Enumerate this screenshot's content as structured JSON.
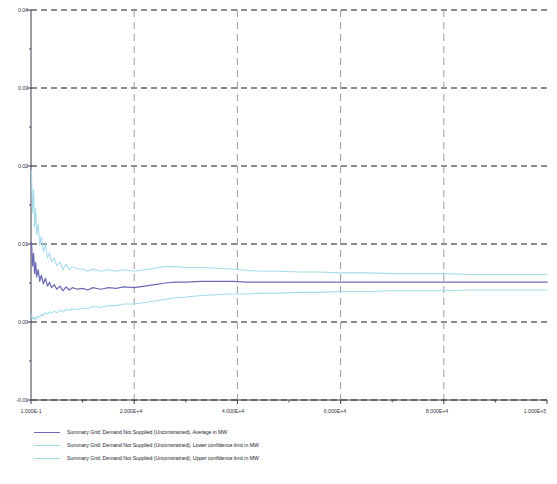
{
  "chart_data": {
    "type": "line",
    "title": "",
    "xlabel": "",
    "ylabel": "",
    "xscale": "linear",
    "grid": true,
    "legend_position": "below-plot",
    "xlim": [
      0,
      100000
    ],
    "ylim": [
      -0.01,
      0.04
    ],
    "y_ticks": [
      "0.04",
      "0.03",
      "0.02",
      "0.01",
      "0.00",
      "-0.01"
    ],
    "y_tick_values": [
      0.04,
      0.03,
      0.02,
      0.01,
      0.0,
      -0.01
    ],
    "y_minor_tick_values": [
      0.035,
      0.025,
      0.015,
      0.005,
      -0.005
    ],
    "x_ticks": [
      "1.000E-1",
      "2.000E+4",
      "4.000E+4",
      "6.000E+4",
      "8.000E+4",
      "1.000E+5"
    ],
    "x_tick_values": [
      0.1,
      20000,
      40000,
      60000,
      80000,
      100000
    ],
    "x_minor_tick_values": [
      10000,
      30000,
      50000,
      70000,
      90000
    ],
    "x_vertical_gridlines": [
      20000,
      40000,
      60000,
      80000
    ],
    "series": [
      {
        "name": "Summary Grid: Demand Not Supplied (Unconstrained), Average in MW",
        "color": "#6b6bb5",
        "short": "average",
        "x": [
          100,
          300,
          500,
          700,
          900,
          1100,
          1400,
          1700,
          2000,
          2400,
          2800,
          3200,
          3600,
          4000,
          4500,
          5000,
          5600,
          6200,
          6800,
          7400,
          8000,
          9000,
          10000,
          11000,
          12000,
          13500,
          15000,
          16500,
          18000,
          20000,
          22000,
          24000,
          26000,
          28000,
          30000,
          33000,
          36000,
          39000,
          42000,
          45000,
          48000,
          52000,
          56000,
          60000,
          65000,
          70000,
          75000,
          80000,
          85000,
          90000,
          95000,
          100000
        ],
        "values": [
          0.0102,
          0.0072,
          0.0088,
          0.0062,
          0.0076,
          0.0058,
          0.0067,
          0.0052,
          0.006,
          0.0049,
          0.0056,
          0.0046,
          0.0051,
          0.0044,
          0.0048,
          0.0042,
          0.0046,
          0.004,
          0.0045,
          0.0041,
          0.0044,
          0.0042,
          0.0043,
          0.0041,
          0.0044,
          0.0042,
          0.0044,
          0.0043,
          0.0045,
          0.0044,
          0.0046,
          0.0048,
          0.005,
          0.0051,
          0.0051,
          0.0052,
          0.0052,
          0.0052,
          0.0051,
          0.0051,
          0.0051,
          0.0051,
          0.0051,
          0.0051,
          0.0051,
          0.0051,
          0.0051,
          0.0051,
          0.0051,
          0.0051,
          0.0051,
          0.0051
        ]
      },
      {
        "name": "Summary Grid: Demand Not Supplied (Unconstrained), Lower confidence limit in MW",
        "color": "#a6dcea",
        "short": "lower",
        "x": [
          100,
          300,
          500,
          700,
          900,
          1100,
          1400,
          1700,
          2000,
          2400,
          2800,
          3200,
          3600,
          4000,
          4500,
          5000,
          5600,
          6200,
          6800,
          7400,
          8000,
          9000,
          10000,
          11000,
          12000,
          13500,
          15000,
          16500,
          18000,
          20000,
          22000,
          24000,
          26000,
          28000,
          30000,
          33000,
          36000,
          39000,
          42000,
          45000,
          48000,
          52000,
          56000,
          60000,
          65000,
          70000,
          75000,
          80000,
          85000,
          90000,
          95000,
          100000
        ],
        "values": [
          0.001,
          0.0004,
          0.0006,
          0.0003,
          0.0006,
          0.0004,
          0.0008,
          0.0006,
          0.001,
          0.0008,
          0.0012,
          0.001,
          0.0013,
          0.0011,
          0.0014,
          0.0012,
          0.0015,
          0.0013,
          0.0016,
          0.0015,
          0.0017,
          0.0016,
          0.0018,
          0.0017,
          0.002,
          0.0019,
          0.0021,
          0.0021,
          0.0023,
          0.0023,
          0.0025,
          0.0027,
          0.0029,
          0.0031,
          0.0032,
          0.0034,
          0.0035,
          0.0036,
          0.0036,
          0.0037,
          0.0037,
          0.0038,
          0.0038,
          0.0039,
          0.0039,
          0.004,
          0.004,
          0.004,
          0.0041,
          0.0041,
          0.0041,
          0.0041
        ]
      },
      {
        "name": "Summary Grid: Demand Not Supplied (Unconstrained), Upper confidence limit in MW",
        "color": "#a6dcea",
        "short": "upper",
        "x": [
          100,
          300,
          500,
          700,
          900,
          1100,
          1400,
          1700,
          2000,
          2400,
          2800,
          3200,
          3600,
          4000,
          4500,
          5000,
          5600,
          6200,
          6800,
          7400,
          8000,
          9000,
          10000,
          11000,
          12000,
          13500,
          15000,
          16500,
          18000,
          20000,
          22000,
          24000,
          26000,
          28000,
          30000,
          33000,
          36000,
          39000,
          42000,
          45000,
          48000,
          52000,
          56000,
          60000,
          65000,
          70000,
          75000,
          80000,
          85000,
          90000,
          95000,
          100000
        ],
        "values": [
          0.0194,
          0.014,
          0.017,
          0.0121,
          0.0146,
          0.0112,
          0.0126,
          0.0098,
          0.011,
          0.009,
          0.01,
          0.0082,
          0.0089,
          0.0077,
          0.0082,
          0.0072,
          0.0077,
          0.0067,
          0.0074,
          0.0067,
          0.0071,
          0.0068,
          0.0068,
          0.0065,
          0.0068,
          0.0065,
          0.0067,
          0.0065,
          0.0067,
          0.0065,
          0.0067,
          0.0069,
          0.0071,
          0.0071,
          0.007,
          0.007,
          0.0069,
          0.0068,
          0.0066,
          0.0065,
          0.0065,
          0.0064,
          0.0064,
          0.0063,
          0.0063,
          0.0062,
          0.0062,
          0.0062,
          0.0061,
          0.0061,
          0.0061,
          0.0061
        ]
      }
    ]
  },
  "axes": {
    "y_tick_labels": [
      "0.04",
      "0.03",
      "0.02",
      "0.01",
      "0.00",
      "-0.01"
    ],
    "x_tick_labels": [
      "1.000E-1",
      "2.000E+4",
      "4.000E+4",
      "6.000E+4",
      "8.000E+4",
      "1.000E+5"
    ]
  },
  "legend": {
    "entries": [
      {
        "label": "Summary Grid: Demand Not Supplied (Unconstrained), Average in MW",
        "color": "#6b6bb5"
      },
      {
        "label": "Summary Grid: Demand Not Supplied (Unconstrained), Lower confidence limit in MW",
        "color": "#a6dcea"
      },
      {
        "label": "Summary Grid: Demand Not Supplied (Unconstrained), Upper confidence limit in MW",
        "color": "#a6dcea"
      }
    ]
  },
  "style": {
    "gridline_color": "#1a1a1a",
    "vertical_gridline_color": "#9a9a9a",
    "axis_color": "#3a3a4a",
    "background": "#ffffff"
  }
}
